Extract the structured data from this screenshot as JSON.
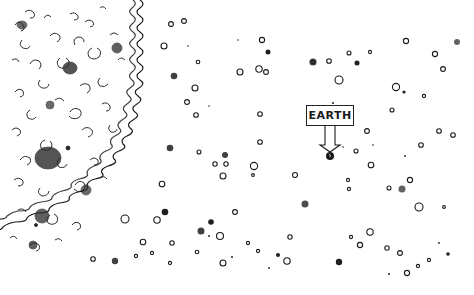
{
  "illustration": {
    "style": "hand-drawn ink sketch",
    "label": "EARTH",
    "regions": {
      "left": "dense cloud of curly scribbles and clumps, bounded by a wavy curved front",
      "right": "sparse field of small open circles and dark dots"
    },
    "earth_marker": {
      "x": 330,
      "y": 156,
      "r": 4
    }
  },
  "colors": {
    "ink": "#1a1a1a",
    "background": "#ffffff"
  }
}
